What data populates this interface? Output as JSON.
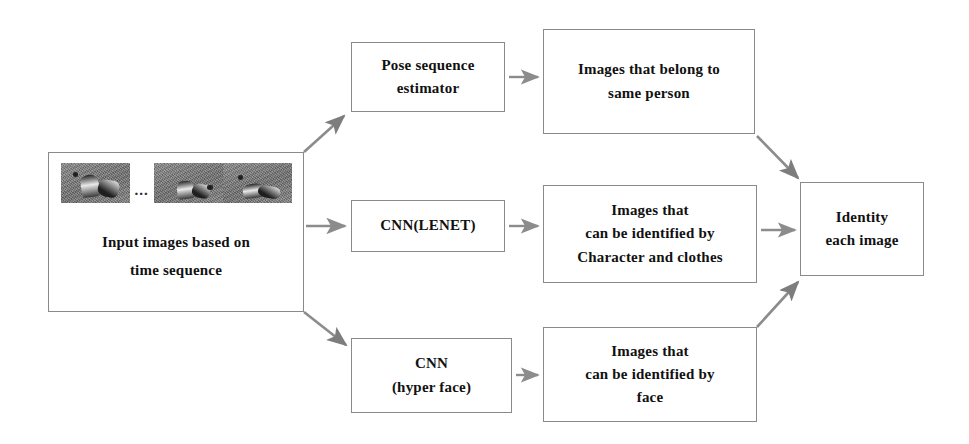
{
  "diagram": {
    "stroke_color": "#8a8a8a",
    "arrow_color": "#8c8c8c",
    "text_color": "#111111",
    "background": "#ffffff"
  },
  "input": {
    "caption_line1": "Input images based on",
    "caption_line2": "time sequence",
    "ellipsis": "...",
    "thumbnails": [
      {
        "alt": "video frame 1"
      },
      {
        "alt": "video frame 2"
      },
      {
        "alt": "video frame 3"
      }
    ]
  },
  "branches": [
    {
      "id": "pose",
      "processor_lines": [
        "Pose sequence",
        "estimator"
      ],
      "result_lines": [
        "Images that belong to",
        "same person"
      ]
    },
    {
      "id": "lenet",
      "processor_lines": [
        "CNN(LENET)"
      ],
      "result_lines": [
        "Images that",
        "can be identified by",
        "Character and clothes"
      ]
    },
    {
      "id": "hyperface",
      "processor_lines": [
        "CNN",
        "(hyper face)"
      ],
      "result_lines": [
        "Images that",
        "can be identified by",
        "face"
      ]
    }
  ],
  "output": {
    "lines": [
      "Identity",
      "each image"
    ]
  }
}
